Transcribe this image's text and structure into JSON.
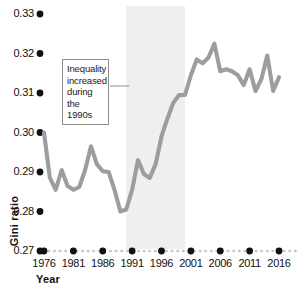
{
  "chart_data": {
    "type": "line",
    "title": "",
    "subtitle": "",
    "xlabel": "Year",
    "ylabel": "Gini ratio",
    "xlim": [
      1975,
      2016.5
    ],
    "ylim": [
      0.27,
      0.333
    ],
    "grid": false,
    "legend": null,
    "legend_position": "none",
    "line_color": "#9d9d9d",
    "xtick_labels": [
      "1976",
      "1981",
      "1986",
      "1991",
      "1996",
      "2001",
      "2006",
      "2011",
      "2016"
    ],
    "xtick_values": [
      1976,
      1981,
      1986,
      1991,
      1996,
      2001,
      2006,
      2011,
      2016
    ],
    "ytick_labels": [
      "0.33",
      "0.32",
      "0.31",
      "0.30",
      "0.29",
      "0.28",
      "0.27"
    ],
    "ytick_values": [
      0.33,
      0.32,
      0.31,
      0.3,
      0.29,
      0.28,
      0.27
    ],
    "shaded_region": {
      "label": "1990s",
      "x_start": 1990,
      "x_end": 2000,
      "color": "#efefef"
    },
    "annotations": [
      {
        "name": "inequality-1990s-note",
        "lines": [
          "Inequality",
          "increased",
          "during the",
          "1990s"
        ],
        "text": "Inequality increased during the 1990s",
        "points_to_x": 1990.5,
        "points_to_y": 0.3105
      }
    ],
    "x": [
      1976,
      1977,
      1978,
      1979,
      1980,
      1981,
      1982,
      1983,
      1984,
      1985,
      1986,
      1987,
      1988,
      1989,
      1990,
      1991,
      1992,
      1993,
      1994,
      1995,
      1996,
      1997,
      1998,
      1999,
      2000,
      2001,
      2002,
      2003,
      2004,
      2005,
      2006,
      2007,
      2008,
      2009,
      2010,
      2011,
      2012,
      2013,
      2014,
      2015,
      2016
    ],
    "y": [
      0.3,
      0.2885,
      0.2855,
      0.2905,
      0.2865,
      0.2855,
      0.2862,
      0.2905,
      0.2965,
      0.292,
      0.2902,
      0.29,
      0.2855,
      0.28,
      0.2805,
      0.2855,
      0.293,
      0.2895,
      0.2885,
      0.292,
      0.299,
      0.3035,
      0.3075,
      0.3095,
      0.3095,
      0.3145,
      0.3185,
      0.3175,
      0.319,
      0.3225,
      0.3155,
      0.316,
      0.3155,
      0.3145,
      0.312,
      0.316,
      0.3105,
      0.3135,
      0.3195,
      0.3105,
      0.314
    ],
    "series": [
      {
        "name": "Gini ratio",
        "values": [
          0.3,
          0.2885,
          0.2855,
          0.2905,
          0.2865,
          0.2855,
          0.2862,
          0.2905,
          0.2965,
          0.292,
          0.2902,
          0.29,
          0.2855,
          0.28,
          0.2805,
          0.2855,
          0.293,
          0.2895,
          0.2885,
          0.292,
          0.299,
          0.3035,
          0.3075,
          0.3095,
          0.3095,
          0.3145,
          0.3185,
          0.3175,
          0.319,
          0.3225,
          0.3155,
          0.316,
          0.3155,
          0.3145,
          0.312,
          0.316,
          0.3105,
          0.3135,
          0.3195,
          0.3105,
          0.314
        ]
      }
    ]
  }
}
